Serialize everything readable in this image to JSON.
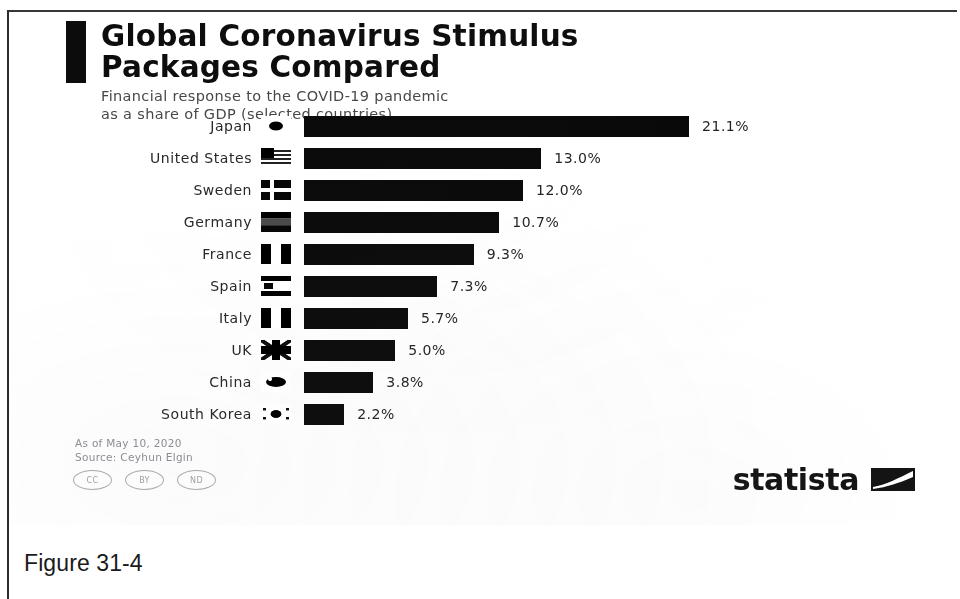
{
  "figure": {
    "caption": "Figure 31-4"
  },
  "infographic": {
    "title": "Global Coronavirus Stimulus\nPackages Compared",
    "subtitle": "Financial response to the COVID-19 pandemic\nas a share of GDP (selected countries)",
    "footer_notes": "As of May 10, 2020\nSource: Ceyhun Elgin",
    "cc_badges": [
      {
        "name": "cc-badge-cc",
        "label": "CC"
      },
      {
        "name": "cc-badge-by",
        "label": "BY"
      },
      {
        "name": "cc-badge-nd",
        "label": "ND"
      }
    ],
    "brand": {
      "wordmark": "statista",
      "mark": "statista-logo-mark"
    }
  },
  "chart_data": {
    "type": "bar",
    "orientation": "horizontal",
    "title": "Global Coronavirus Stimulus Packages Compared",
    "subtitle": "Financial response to the COVID-19 pandemic as a share of GDP (selected countries)",
    "xlabel": "",
    "ylabel": "",
    "unit": "% of GDP",
    "grid": false,
    "legend": "none",
    "xlim": [
      0,
      21.1
    ],
    "categories": [
      "Japan",
      "United States",
      "Sweden",
      "Germany",
      "France",
      "Spain",
      "Italy",
      "UK",
      "China",
      "South Korea"
    ],
    "values": [
      21.1,
      13.0,
      12.0,
      10.7,
      9.3,
      7.3,
      5.7,
      5.0,
      3.8,
      2.2
    ],
    "value_labels": [
      "21.1%",
      "13.0%",
      "12.0%",
      "10.7%",
      "9.3%",
      "7.3%",
      "5.7%",
      "5.0%",
      "3.8%",
      "2.2%"
    ],
    "bar_color": "#0d0d0d",
    "rows": [
      {
        "country": "Japan",
        "value": 21.1,
        "label": "21.1%",
        "flag": "flag-japan"
      },
      {
        "country": "United States",
        "value": 13.0,
        "label": "13.0%",
        "flag": "flag-united-states"
      },
      {
        "country": "Sweden",
        "value": 12.0,
        "label": "12.0%",
        "flag": "flag-sweden"
      },
      {
        "country": "Germany",
        "value": 10.7,
        "label": "10.7%",
        "flag": "flag-germany"
      },
      {
        "country": "France",
        "value": 9.3,
        "label": "9.3%",
        "flag": "flag-france"
      },
      {
        "country": "Spain",
        "value": 7.3,
        "label": "7.3%",
        "flag": "flag-spain"
      },
      {
        "country": "Italy",
        "value": 5.7,
        "label": "5.7%",
        "flag": "flag-italy"
      },
      {
        "country": "UK",
        "value": 5.0,
        "label": "5.0%",
        "flag": "flag-uk"
      },
      {
        "country": "China",
        "value": 3.8,
        "label": "3.8%",
        "flag": "flag-china"
      },
      {
        "country": "South Korea",
        "value": 2.2,
        "label": "2.2%",
        "flag": "flag-south-korea"
      }
    ]
  }
}
